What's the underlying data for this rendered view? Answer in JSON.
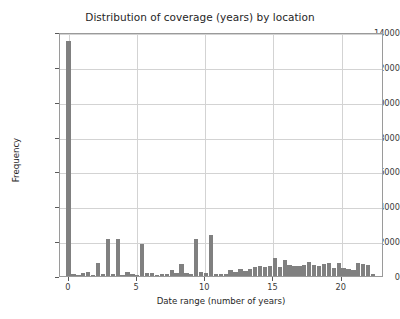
{
  "chart_data": {
    "type": "bar",
    "title": "Distribution of coverage (years) by location",
    "xlabel": "Date range (number of years)",
    "ylabel": "Frequency",
    "xlim": [
      -0.65,
      23.1
    ],
    "ylim": [
      0,
      14000
    ],
    "xticks": [
      0,
      5,
      10,
      15,
      20
    ],
    "yticks": [
      0,
      2000,
      4000,
      6000,
      8000,
      10000,
      12000,
      14000
    ],
    "grid": "y-and-x major gridlines on",
    "legend": "none",
    "bar_color": "#808080",
    "bin_width": 0.36,
    "x": [
      0.0,
      0.36,
      0.72,
      1.08,
      1.44,
      1.8,
      2.16,
      2.52,
      2.88,
      3.24,
      3.6,
      3.96,
      4.32,
      4.68,
      5.04,
      5.4,
      5.76,
      6.12,
      6.48,
      6.84,
      7.2,
      7.56,
      7.92,
      8.28,
      8.64,
      9.0,
      9.36,
      9.72,
      10.08,
      10.44,
      10.8,
      11.16,
      11.52,
      11.88,
      12.24,
      12.6,
      12.96,
      13.32,
      13.68,
      14.04,
      14.4,
      14.76,
      15.12,
      15.48,
      15.84,
      16.2,
      16.56,
      16.92,
      17.28,
      17.64,
      18.0,
      18.36,
      18.72,
      19.08,
      19.44,
      19.8,
      20.16,
      20.52,
      20.88,
      21.24,
      21.6,
      21.96,
      22.32
    ],
    "values": [
      13500,
      90,
      70,
      150,
      230,
      60,
      760,
      120,
      2150,
      120,
      2100,
      80,
      220,
      120,
      70,
      1850,
      150,
      180,
      70,
      140,
      130,
      350,
      170,
      700,
      200,
      140,
      2150,
      210,
      180,
      2350,
      120,
      130,
      110,
      330,
      210,
      380,
      300,
      420,
      500,
      560,
      540,
      560,
      1050,
      540,
      900,
      620,
      560,
      600,
      640,
      800,
      620,
      560,
      700,
      740,
      480,
      760,
      480,
      380,
      360,
      720,
      700,
      640,
      120
    ]
  },
  "axes": {
    "ytick_labels": [
      "0",
      "2000",
      "4000",
      "6000",
      "8000",
      "10000",
      "12000",
      "14000"
    ],
    "xtick_labels": [
      "0",
      "5",
      "10",
      "15",
      "20"
    ]
  }
}
